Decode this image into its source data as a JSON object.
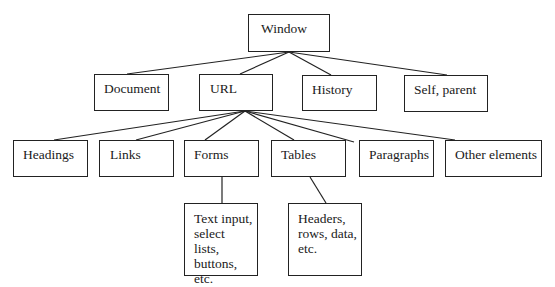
{
  "diagram": {
    "type": "tree",
    "nodes": [
      {
        "id": "window",
        "label": "Window",
        "x": 248,
        "y": 14,
        "w": 82,
        "h": 38
      },
      {
        "id": "document",
        "label": "Document",
        "x": 94,
        "y": 74,
        "w": 75,
        "h": 37
      },
      {
        "id": "url",
        "label": "URL",
        "x": 199,
        "y": 74,
        "w": 74,
        "h": 37
      },
      {
        "id": "history",
        "label": "History",
        "x": 302,
        "y": 75,
        "w": 75,
        "h": 36
      },
      {
        "id": "self-parent",
        "label": "Self, parent",
        "x": 404,
        "y": 75,
        "w": 84,
        "h": 37
      },
      {
        "id": "headings",
        "label": "Headings",
        "x": 13,
        "y": 140,
        "w": 75,
        "h": 37
      },
      {
        "id": "links",
        "label": "Links",
        "x": 99,
        "y": 140,
        "w": 75,
        "h": 37
      },
      {
        "id": "forms",
        "label": "Forms",
        "x": 184,
        "y": 140,
        "w": 75,
        "h": 37
      },
      {
        "id": "tables",
        "label": "Tables",
        "x": 271,
        "y": 140,
        "w": 75,
        "h": 37
      },
      {
        "id": "paragraphs",
        "label": "Paragraphs",
        "x": 359,
        "y": 140,
        "w": 75,
        "h": 37
      },
      {
        "id": "other-elements",
        "label": "Other elements",
        "x": 445,
        "y": 140,
        "w": 97,
        "h": 37
      },
      {
        "id": "forms-detail",
        "label": "Text input, select lists, buttons, etc.",
        "x": 184,
        "y": 203,
        "w": 74,
        "h": 73
      },
      {
        "id": "tables-detail",
        "label": "Headers, rows, data, etc.",
        "x": 288,
        "y": 203,
        "w": 74,
        "h": 73
      }
    ],
    "edges": [
      {
        "from": "window",
        "to": "document",
        "x1": 289,
        "y1": 52,
        "x2": 127,
        "y2": 74
      },
      {
        "from": "window",
        "to": "url",
        "x1": 289,
        "y1": 52,
        "x2": 240,
        "y2": 74
      },
      {
        "from": "window",
        "to": "history",
        "x1": 289,
        "y1": 52,
        "x2": 331,
        "y2": 75
      },
      {
        "from": "window",
        "to": "self-parent",
        "x1": 289,
        "y1": 52,
        "x2": 447,
        "y2": 75
      },
      {
        "from": "url",
        "to": "headings",
        "x1": 245,
        "y1": 111,
        "x2": 54,
        "y2": 140
      },
      {
        "from": "url",
        "to": "links",
        "x1": 245,
        "y1": 111,
        "x2": 136,
        "y2": 140
      },
      {
        "from": "url",
        "to": "forms",
        "x1": 245,
        "y1": 111,
        "x2": 205,
        "y2": 140
      },
      {
        "from": "url",
        "to": "tables",
        "x1": 245,
        "y1": 111,
        "x2": 294,
        "y2": 140
      },
      {
        "from": "url",
        "to": "paragraphs",
        "x1": 245,
        "y1": 111,
        "x2": 354,
        "y2": 142
      },
      {
        "from": "url",
        "to": "other-elements",
        "x1": 245,
        "y1": 111,
        "x2": 455,
        "y2": 140
      },
      {
        "from": "forms",
        "to": "forms-detail",
        "x1": 222,
        "y1": 177,
        "x2": 222,
        "y2": 203
      },
      {
        "from": "tables",
        "to": "tables-detail",
        "x1": 310,
        "y1": 177,
        "x2": 326,
        "y2": 203
      }
    ]
  }
}
